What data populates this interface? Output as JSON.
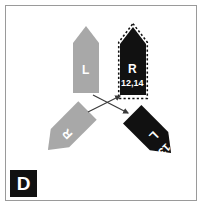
{
  "panel": {
    "letter": "D",
    "background_color": "#ffffff",
    "frame_color": "#9a9a9a",
    "badge_background": "#111111",
    "badge_text_color": "#ffffff"
  },
  "colors": {
    "gray_shape": "#a8a8a8",
    "black_shape": "#111111",
    "label_text": "#ffffff",
    "swap_arrow": "#3a3a3a",
    "selection_dash": "#111111"
  },
  "shapes": [
    {
      "id": "gray-arrow-up-left",
      "label": "L",
      "secondary_label": "",
      "fill": "#a8a8a8",
      "rotation_deg": 0,
      "selected": false,
      "description": "gray arrow pointing up, labeled L"
    },
    {
      "id": "black-arrow-up-right",
      "label": "R",
      "secondary_label": "12,14",
      "fill": "#111111",
      "rotation_deg": 0,
      "selected": true,
      "description": "black arrow pointing up, labeled R with coordinates 12,14, dashed selection outline"
    },
    {
      "id": "gray-arrow-lower-left",
      "label": "R",
      "secondary_label": "",
      "fill": "#a8a8a8",
      "rotation_deg": 225,
      "selected": false,
      "description": "gray arrow pointing up-right, rotated, labeled R"
    },
    {
      "id": "black-arrow-lower-right",
      "label": "L",
      "secondary_label": "13",
      "fill": "#111111",
      "rotation_deg": 135,
      "selected": false,
      "description": "black arrow pointing up-left, rotated, labeled L with 13"
    }
  ],
  "swap_arrows": [
    {
      "id": "swap-arrow-to-upper-right",
      "from": "lower-left",
      "to": "upper-right",
      "description": "arrow from lower-left shape toward upper-right black arrow"
    },
    {
      "id": "swap-arrow-to-lower-right",
      "from": "upper-left",
      "to": "lower-right",
      "description": "arrow from upper-left shape toward lower-right black arrow"
    }
  ]
}
